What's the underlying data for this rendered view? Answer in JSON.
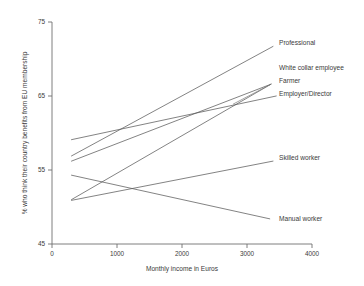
{
  "chart_data": {
    "type": "line",
    "title": "",
    "xlabel": "Monthly income in Euros",
    "ylabel": "% who think their country benefits from EU membership",
    "xlim": [
      0,
      4000
    ],
    "ylim": [
      45,
      75
    ],
    "xticks": [
      0,
      1000,
      2000,
      3000,
      4000
    ],
    "xtick_labels": [
      "0",
      "1000",
      "2000",
      "3000",
      "4000"
    ],
    "yticks": [
      45,
      55,
      65,
      75
    ],
    "ytick_labels": [
      "45",
      "55",
      "65",
      "75"
    ],
    "grid": false,
    "legend_position": "right-inline-labels",
    "series": [
      {
        "name": "Professional",
        "label": "Professional",
        "x": [
          300,
          3400
        ],
        "y": [
          56.9,
          71.7
        ]
      },
      {
        "name": "White collar employee",
        "label": "White collar employee",
        "x": [
          300,
          3370
        ],
        "y": [
          56.2,
          66.6
        ]
      },
      {
        "name": "Farmer",
        "label": "Farmer",
        "x": [
          300,
          3370
        ],
        "y": [
          51.0,
          66.6
        ]
      },
      {
        "name": "Employer/Director",
        "label": "Employer/Director",
        "x": [
          300,
          3450
        ],
        "y": [
          59.1,
          65.0
        ]
      },
      {
        "name": "Skilled worker",
        "label": "Skilled worker",
        "x": [
          300,
          3400
        ],
        "y": [
          50.9,
          56.2
        ]
      },
      {
        "name": "Manual worker",
        "label": "Manual worker",
        "x": [
          300,
          3350
        ],
        "y": [
          54.3,
          48.4
        ]
      }
    ]
  }
}
